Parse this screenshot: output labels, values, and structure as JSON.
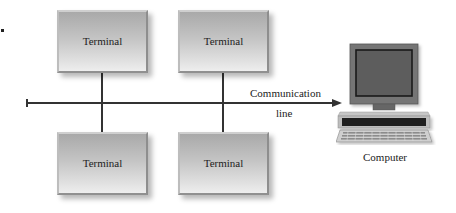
{
  "diagram": {
    "terminals": [
      {
        "label": "Terminal",
        "position": "top-left"
      },
      {
        "label": "Terminal",
        "position": "top-right"
      },
      {
        "label": "Terminal",
        "position": "bottom-left"
      },
      {
        "label": "Terminal",
        "position": "bottom-right"
      }
    ],
    "bus": {
      "label_line1": "Communication",
      "label_line2": "line"
    },
    "computer": {
      "label": "Computer"
    },
    "colors": {
      "line": "#333333",
      "box_top": "#a9a9a9",
      "box_bottom": "#eeeeee",
      "monitor": "#6f6f6f",
      "screen": "#5a5a5a"
    }
  }
}
